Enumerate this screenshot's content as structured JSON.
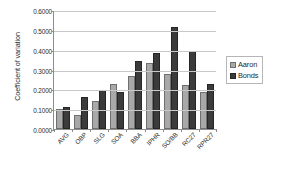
{
  "chart_data": {
    "type": "bar",
    "title": "",
    "xlabel": "",
    "ylabel": "Coefficient of variation",
    "ylim": [
      0.0,
      0.6
    ],
    "ytick_step": 0.1,
    "ytick_labels": [
      "0.6000",
      "0.5000",
      "0.4000",
      "0.3000",
      "0.2000",
      "0.1000",
      "0.0000"
    ],
    "ytick_values": [
      0.6,
      0.5,
      0.4,
      0.3,
      0.2,
      0.1,
      0.0
    ],
    "grid": true,
    "legend_position": "right",
    "categories": [
      "AVG",
      "OBP",
      "SLG",
      "SOA",
      "BBA",
      "IPHR",
      "SO/BB",
      "RC27",
      "RPR27"
    ],
    "series": [
      {
        "name": "Aaron",
        "color": "#a8a8a8",
        "values": [
          0.103,
          0.07,
          0.143,
          0.227,
          0.267,
          0.332,
          0.276,
          0.223,
          0.188
        ]
      },
      {
        "name": "Bonds",
        "color": "#3b3b3b",
        "values": [
          0.112,
          0.163,
          0.196,
          0.188,
          0.343,
          0.384,
          0.512,
          0.395,
          0.229
        ]
      }
    ]
  },
  "legend": {
    "items": [
      {
        "label": "Aaron"
      },
      {
        "label": "Bonds"
      }
    ]
  }
}
